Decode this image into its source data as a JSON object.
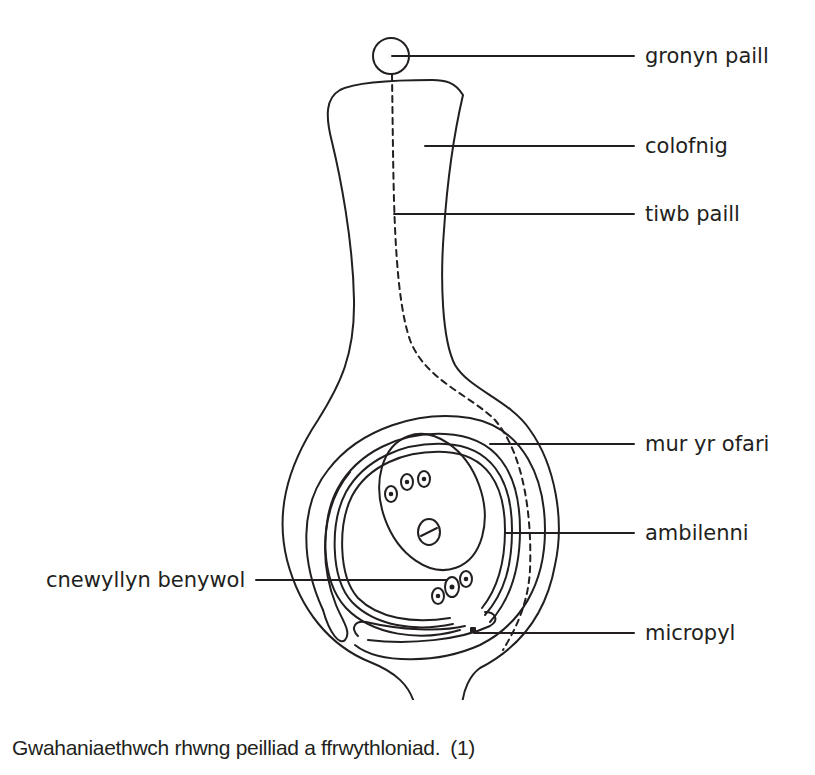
{
  "diagram": {
    "stroke_color": "#231f20",
    "labels": {
      "pollen_grain": "gronyn paill",
      "stigma_style": "colofnig",
      "pollen_tube": "tiwb paill",
      "ovary_wall": "mur yr ofari",
      "integuments": "ambilenni",
      "female_nucleus": "cnewyllyn benywol",
      "micropyle": "micropyl"
    }
  },
  "question": {
    "text": "Gwahaniaethwch rhwng peilliad a ffrwythloniad.",
    "marks": "(1)"
  }
}
